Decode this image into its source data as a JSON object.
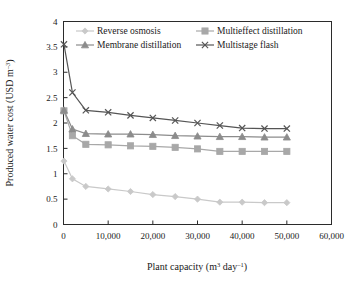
{
  "chart_data": {
    "type": "line",
    "title": "",
    "xlabel": "Plant capacity (m3 day-1)",
    "ylabel": "Produced water cost (USD m-3)",
    "xlabel_parts": {
      "base": "Plant capacity (m",
      "sup1": "3",
      "mid": " day",
      "sup2": "–1",
      "tail": ")"
    },
    "ylabel_parts": {
      "base": "Produced water cost (USD m",
      "sup": "–3",
      "tail": ")"
    },
    "xlim": [
      0,
      60000
    ],
    "ylim": [
      0,
      4
    ],
    "xticks": [
      0,
      10000,
      20000,
      30000,
      40000,
      50000,
      60000
    ],
    "xticklabels": [
      "0",
      "10,000",
      "20,000",
      "30,000",
      "40,000",
      "50,000",
      "60,000"
    ],
    "yticks": [
      0,
      0.5,
      1,
      1.5,
      2,
      2.5,
      3,
      3.5,
      4
    ],
    "yticklabels": [
      "0",
      "0.5",
      "1",
      "1.5",
      "2",
      "2.5",
      "3",
      "3.5",
      "4"
    ],
    "grid": false,
    "legend_position": "top-left-inside",
    "x": [
      100,
      2000,
      5000,
      10000,
      15000,
      20000,
      25000,
      30000,
      35000,
      40000,
      45000,
      50000
    ],
    "series": [
      {
        "name": "Reverse osmosis",
        "marker": "diamond",
        "color": "#c9c9c9",
        "values": [
          1.25,
          0.9,
          0.75,
          0.7,
          0.65,
          0.59,
          0.55,
          0.5,
          0.44,
          0.44,
          0.43,
          0.43
        ]
      },
      {
        "name": "Multieffect distillation",
        "marker": "square",
        "color": "#a8a8a8",
        "values": [
          2.24,
          1.75,
          1.58,
          1.57,
          1.55,
          1.54,
          1.52,
          1.49,
          1.44,
          1.44,
          1.44,
          1.44
        ]
      },
      {
        "name": "Membrane distillation",
        "marker": "triangle",
        "color": "#8c8c8c",
        "values": [
          2.25,
          1.88,
          1.79,
          1.78,
          1.78,
          1.77,
          1.75,
          1.74,
          1.73,
          1.73,
          1.72,
          1.72
        ]
      },
      {
        "name": "Multistage flash",
        "marker": "cross",
        "color": "#555555",
        "values": [
          3.55,
          2.6,
          2.25,
          2.21,
          2.15,
          2.1,
          2.05,
          2.0,
          1.95,
          1.9,
          1.89,
          1.89
        ]
      }
    ]
  },
  "legend": {
    "entries": [
      {
        "label": "Reverse osmosis"
      },
      {
        "label": "Multieffect distillation"
      },
      {
        "label": "Membrane distillation"
      },
      {
        "label": "Multistage flash"
      }
    ]
  }
}
